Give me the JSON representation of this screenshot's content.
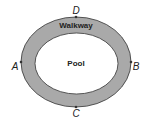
{
  "diagram": {
    "type": "annular-ellipse",
    "regions": {
      "outer_label": "Walkway",
      "inner_label": "Pool"
    },
    "points": [
      {
        "id": "D",
        "label": "D",
        "position": "top"
      },
      {
        "id": "A",
        "label": "A",
        "position": "left"
      },
      {
        "id": "B",
        "label": "B",
        "position": "right"
      },
      {
        "id": "C",
        "label": "C",
        "position": "bottom"
      }
    ],
    "colors": {
      "walkway_fill": "#a9a9a9",
      "pool_fill": "#ffffff",
      "stroke": "#333333",
      "label": "#222222"
    }
  }
}
